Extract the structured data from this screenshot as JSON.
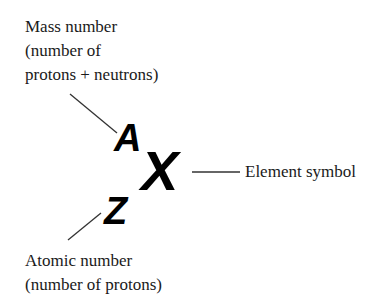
{
  "diagram": {
    "mass_label": {
      "lines": [
        "Mass number",
        "(number of",
        "protons + neutrons)"
      ]
    },
    "atomic_label": {
      "lines": [
        "Atomic number",
        "(number of protons)"
      ]
    },
    "element_label": "Element symbol",
    "symbols": {
      "mass": "A",
      "element": "X",
      "atomic": "Z"
    },
    "colors": {
      "text": "#1a1a1a",
      "symbol": "#000000",
      "leader_line": "#333333"
    }
  }
}
